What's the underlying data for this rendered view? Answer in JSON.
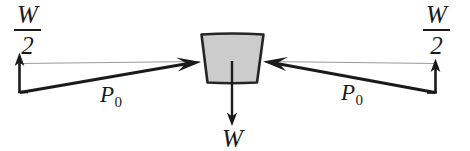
{
  "figure": {
    "type": "free-body-force-diagram",
    "background_color": "#ffffff",
    "ink_color": "#1a1a1a",
    "block": {
      "name": "trapezoidal-block",
      "fill_color": "#cccccc",
      "stroke_color": "#262626",
      "top_width_px": 62,
      "bottom_width_px": 46,
      "height_px": 48
    },
    "labels": {
      "half_weight_left": {
        "numerator": "W",
        "denominator": "2"
      },
      "half_weight_right": {
        "numerator": "W",
        "denominator": "2"
      },
      "force_left": {
        "symbol": "P",
        "subscript": "0"
      },
      "force_right": {
        "symbol": "P",
        "subscript": "0"
      },
      "weight": "W"
    },
    "arrows": {
      "reaction_left": {
        "label": "W/2",
        "direction": "up"
      },
      "reaction_right": {
        "label": "W/2",
        "direction": "up"
      },
      "force_left": {
        "label": "P0",
        "direction": "up-right"
      },
      "force_right": {
        "label": "P0",
        "direction": "up-left"
      },
      "weight": {
        "label": "W",
        "direction": "down"
      }
    }
  }
}
